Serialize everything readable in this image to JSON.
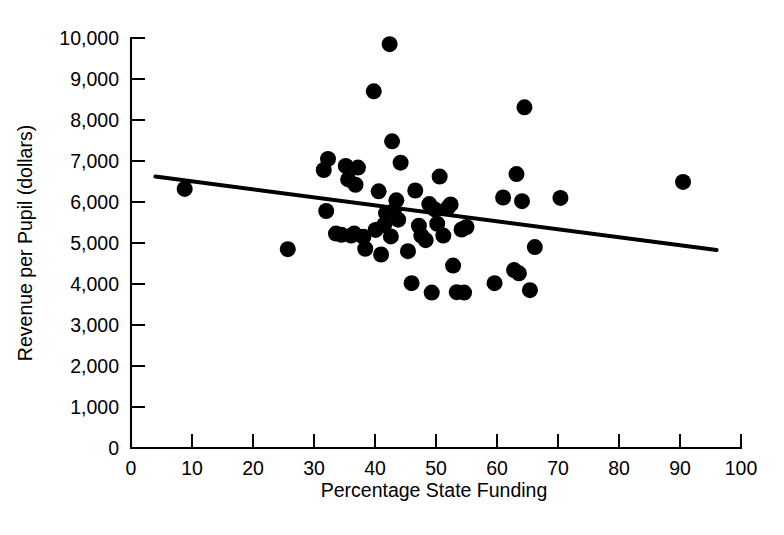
{
  "chart_data": {
    "type": "scatter",
    "title": "",
    "xlabel": "Percentage State Funding",
    "ylabel": "Revenue per Pupil (dollars)",
    "xlim": [
      0,
      100
    ],
    "ylim": [
      0,
      10000
    ],
    "xticks": [
      0,
      10,
      20,
      30,
      40,
      50,
      60,
      70,
      80,
      90,
      100
    ],
    "xtick_labels": [
      "0",
      "10",
      "20",
      "30",
      "40",
      "50",
      "60",
      "70",
      "80",
      "90",
      "100"
    ],
    "yticks": [
      0,
      1000,
      2000,
      3000,
      4000,
      5000,
      6000,
      7000,
      8000,
      9000,
      10000
    ],
    "ytick_labels": [
      "0",
      "1,000",
      "2,000",
      "3,000",
      "4,000",
      "5,000",
      "6,000",
      "7,000",
      "8,000",
      "9,000",
      "10,000"
    ],
    "grid": false,
    "legend": false,
    "marker_color": "#000000",
    "marker_size": 9,
    "series": [
      {
        "name": "School districts",
        "points": [
          [
            8.8,
            6320
          ],
          [
            25.7,
            4850
          ],
          [
            31.6,
            6780
          ],
          [
            32.0,
            5780
          ],
          [
            32.3,
            7050
          ],
          [
            33.6,
            5230
          ],
          [
            34.5,
            5200
          ],
          [
            35.2,
            6880
          ],
          [
            35.6,
            6550
          ],
          [
            36.1,
            5180
          ],
          [
            36.6,
            5230
          ],
          [
            36.8,
            6420
          ],
          [
            37.2,
            6840
          ],
          [
            38.1,
            5150
          ],
          [
            38.4,
            4860
          ],
          [
            39.8,
            8700
          ],
          [
            40.1,
            5320
          ],
          [
            40.6,
            6260
          ],
          [
            41.0,
            4720
          ],
          [
            41.5,
            5440
          ],
          [
            41.8,
            5730
          ],
          [
            42.4,
            9850
          ],
          [
            42.6,
            5160
          ],
          [
            42.8,
            7480
          ],
          [
            43.1,
            5790
          ],
          [
            43.5,
            6040
          ],
          [
            43.8,
            5570
          ],
          [
            44.2,
            6960
          ],
          [
            45.4,
            4800
          ],
          [
            46.0,
            4020
          ],
          [
            46.6,
            6280
          ],
          [
            47.2,
            5420
          ],
          [
            47.6,
            5180
          ],
          [
            48.3,
            5070
          ],
          [
            48.9,
            5950
          ],
          [
            49.3,
            3790
          ],
          [
            49.8,
            5820
          ],
          [
            50.2,
            5470
          ],
          [
            50.6,
            6620
          ],
          [
            51.2,
            5180
          ],
          [
            52.0,
            5870
          ],
          [
            52.4,
            5940
          ],
          [
            52.8,
            4450
          ],
          [
            53.4,
            3800
          ],
          [
            54.2,
            5330
          ],
          [
            54.6,
            3790
          ],
          [
            55.0,
            5390
          ],
          [
            59.6,
            4020
          ],
          [
            61.0,
            6110
          ],
          [
            62.8,
            4340
          ],
          [
            63.2,
            6680
          ],
          [
            63.6,
            4260
          ],
          [
            64.1,
            6020
          ],
          [
            64.5,
            8310
          ],
          [
            65.4,
            3850
          ],
          [
            66.2,
            4900
          ],
          [
            70.4,
            6100
          ],
          [
            90.5,
            6490
          ]
        ]
      }
    ],
    "trend_line": {
      "name": "least-squares regression line",
      "x_start": 4.0,
      "y_start": 6620,
      "x_end": 96.0,
      "y_end": 4830,
      "color": "#000000"
    }
  }
}
